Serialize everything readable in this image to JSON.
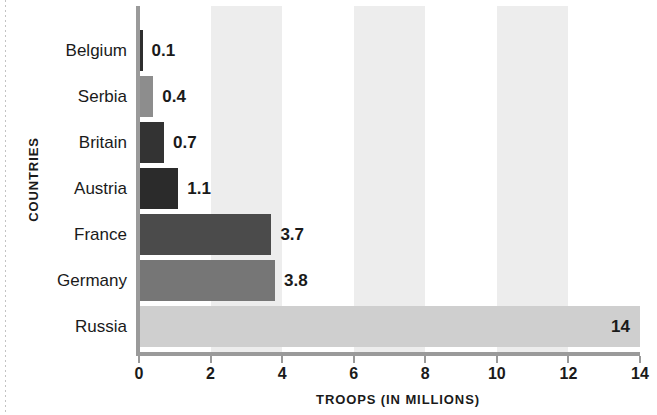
{
  "chart_data": {
    "type": "bar",
    "orientation": "horizontal",
    "title": "",
    "xlabel": "TROOPS (IN MILLIONS)",
    "ylabel": "COUNTRIES",
    "categories": [
      "Belgium",
      "Serbia",
      "Britain",
      "Austria",
      "France",
      "Germany",
      "Russia"
    ],
    "values": [
      0.1,
      0.4,
      0.7,
      1.1,
      3.7,
      3.8,
      14
    ],
    "value_labels": [
      "0.1",
      "0.4",
      "0.7",
      "1.1",
      "3.7",
      "3.8",
      "14"
    ],
    "bar_colors": [
      "#2e2e2e",
      "#8d8d8d",
      "#333333",
      "#2b2b2b",
      "#4b4b4b",
      "#767676",
      "#cfcfcf"
    ],
    "label_positions": [
      "outside",
      "outside",
      "outside",
      "outside",
      "outside",
      "outside",
      "inside"
    ],
    "xlim": [
      0,
      14
    ],
    "xticks": [
      0,
      2,
      4,
      6,
      8,
      10,
      12,
      14
    ],
    "xtick_labels": [
      "0",
      "2",
      "4",
      "6",
      "8",
      "10",
      "12",
      "14"
    ],
    "grid": false,
    "band_color": "#ededed",
    "band_ranges": [
      [
        2,
        4
      ],
      [
        6,
        8
      ],
      [
        10,
        12
      ]
    ],
    "axis_color": "#9a9a9a",
    "background": "#ffffff",
    "legend": null
  }
}
